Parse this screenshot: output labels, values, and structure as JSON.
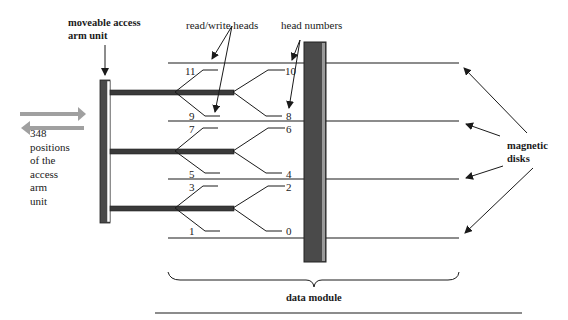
{
  "diagram": {
    "labels": {
      "arm_unit": [
        "moveable access",
        "arm unit"
      ],
      "rw_heads": "read/write heads",
      "head_numbers": "head numbers",
      "magnetic_disks": [
        "magnetic",
        "disks"
      ],
      "positions": [
        "348",
        "positions",
        "of the",
        "access",
        "arm",
        "unit"
      ],
      "data_module": "data module"
    },
    "head_numbers": {
      "left": [
        "11",
        "9",
        "7",
        "5",
        "3",
        "1"
      ],
      "right": [
        "10",
        "8",
        "6",
        "4",
        "2",
        "0"
      ]
    },
    "colors": {
      "ink": "#1a1a1a",
      "spindle": "#4a4a4a",
      "arrow_gray": "#a0a0a0"
    }
  }
}
